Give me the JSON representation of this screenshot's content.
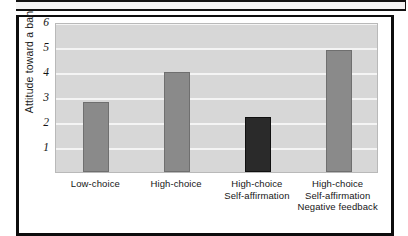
{
  "figure": {
    "background_color": "#ffffff",
    "frame_color": "#0d0d0d",
    "plot_background_color": "#d7d7d7",
    "gridline_color": "#f4f4f4"
  },
  "chart_data": {
    "type": "bar",
    "title": "",
    "xlabel": "",
    "ylabel": "Attitude toward a ban",
    "ylim": [
      0,
      6
    ],
    "yticks": [
      1,
      2,
      3,
      4,
      5,
      6
    ],
    "ytick_labels": [
      "1",
      "2",
      "3",
      "4",
      "5",
      "6"
    ],
    "grid": true,
    "legend": false,
    "categories": [
      "Low-choice",
      "High-choice",
      "High-choice Self-affirmation",
      "High-choice Self-affirmation Negative feedback"
    ],
    "category_lines": [
      [
        "Low-choice"
      ],
      [
        "High-choice"
      ],
      [
        "High-choice",
        "Self-affirmation"
      ],
      [
        "High-choice",
        "Self-affirmation",
        "Negative feedback"
      ]
    ],
    "values": [
      2.8,
      4.0,
      2.2,
      4.9
    ],
    "bar_colors": [
      "#8a8a8a",
      "#8a8a8a",
      "#2a2a2a",
      "#8a8a8a"
    ],
    "highlight_index": 2,
    "highlight_color": "#2a2a2a",
    "default_bar_color": "#8a8a8a"
  }
}
